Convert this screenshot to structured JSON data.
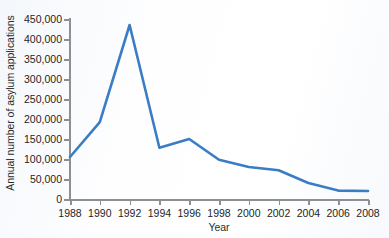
{
  "chart_data": {
    "type": "line",
    "title": "",
    "xlabel": "Year",
    "ylabel": "Annual number of asylum applications",
    "xlim": [
      1988,
      2008
    ],
    "ylim": [
      0,
      450000
    ],
    "grid": false,
    "legend": false,
    "line_color": "#3b7dc4",
    "x_tick_labels": [
      "1988",
      "1990",
      "1992",
      "1994",
      "1996",
      "1998",
      "2000",
      "2002",
      "2004",
      "2006",
      "2008"
    ],
    "x_tick_values": [
      1988,
      1990,
      1992,
      1994,
      1996,
      1998,
      2000,
      2002,
      2004,
      2006,
      2008
    ],
    "y_tick_labels": [
      "0",
      "50,000",
      "100,000",
      "150,000",
      "200,000",
      "250,000",
      "300,000",
      "350,000",
      "400,000",
      "450,000"
    ],
    "y_tick_values": [
      0,
      50000,
      100000,
      150000,
      200000,
      250000,
      300000,
      350000,
      400000,
      450000
    ],
    "x": [
      1988,
      1990,
      1992,
      1994,
      1996,
      1998,
      2000,
      2002,
      2004,
      2006,
      2008
    ],
    "values": [
      105000,
      192000,
      435000,
      128000,
      150000,
      98000,
      80000,
      72000,
      40000,
      21000,
      20000
    ],
    "series": [
      {
        "name": "Annual number of asylum applications",
        "values": [
          105000,
          192000,
          435000,
          128000,
          150000,
          98000,
          80000,
          72000,
          40000,
          21000,
          20000
        ]
      }
    ]
  }
}
